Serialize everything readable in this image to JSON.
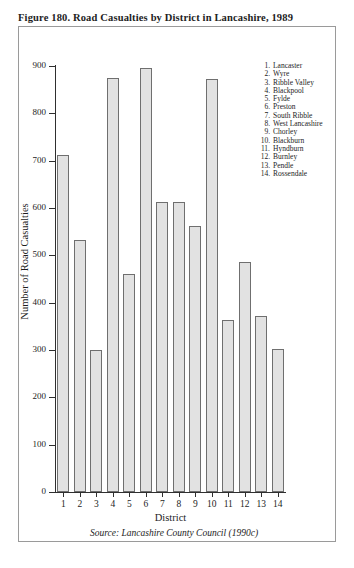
{
  "figure": {
    "title": "Figure 180.  Road Casualties by District in Lancashire, 1989",
    "source": "Source: Lancashire County Council (1990c)"
  },
  "legend": {
    "items": [
      {
        "num": "1.",
        "label": "Lancaster"
      },
      {
        "num": "2.",
        "label": "Wyre"
      },
      {
        "num": "3.",
        "label": "Ribble Valley"
      },
      {
        "num": "4.",
        "label": "Blackpool"
      },
      {
        "num": "5.",
        "label": "Fylde"
      },
      {
        "num": "6.",
        "label": "Preston"
      },
      {
        "num": "7.",
        "label": "South Ribble"
      },
      {
        "num": "8.",
        "label": "West Lancashire"
      },
      {
        "num": "9.",
        "label": "Chorley"
      },
      {
        "num": "10.",
        "label": "Blackburn"
      },
      {
        "num": "11.",
        "label": "Hyndburn"
      },
      {
        "num": "12.",
        "label": "Burnley"
      },
      {
        "num": "13.",
        "label": "Pendle"
      },
      {
        "num": "14.",
        "label": "Rossendale"
      }
    ]
  },
  "chart_data": {
    "type": "bar",
    "title": "Figure 180.  Road Casualties by District in Lancashire, 1989",
    "xlabel": "District",
    "ylabel": "Number of Road Casualties",
    "categories": [
      "1",
      "2",
      "3",
      "4",
      "5",
      "6",
      "7",
      "8",
      "9",
      "10",
      "11",
      "12",
      "13",
      "14"
    ],
    "category_names": [
      "Lancaster",
      "Wyre",
      "Ribble Valley",
      "Blackpool",
      "Fylde",
      "Preston",
      "South Ribble",
      "West Lancashire",
      "Chorley",
      "Blackburn",
      "Hyndburn",
      "Burnley",
      "Pendle",
      "Rossendale"
    ],
    "values": [
      712,
      533,
      300,
      875,
      461,
      895,
      613,
      613,
      563,
      873,
      364,
      486,
      371,
      303
    ],
    "ylim": [
      0,
      900
    ],
    "yticks": [
      0,
      100,
      200,
      300,
      400,
      500,
      600,
      700,
      800,
      900
    ],
    "ytick_labels": [
      "0",
      "100",
      "200",
      "300",
      "400",
      "500",
      "600",
      "700",
      "800",
      "900"
    ],
    "grid": false,
    "legend_position": "upper-right",
    "bar_fill_color": "#e2e2e2",
    "bar_edge_color": "#6f6f6f"
  }
}
